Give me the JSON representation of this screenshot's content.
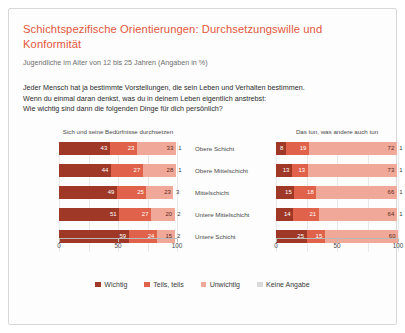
{
  "title": "Schichtspezifische Orientierungen: Durchsetzungswille und Konformität",
  "subtitle": "Jugendliche im Alter von 12 bis 25 Jahren (Angaben in %)",
  "question": {
    "line1": "Jeder Mensch hat ja bestimmte Vorstellungen, die sein Leben und Verhalten bestimmen.",
    "line2": "Wenn du einmal daran denkst, was du in deinem Leben eigentlich anstrebst:",
    "line3": "Wie wichtig sind dann die folgenden Dinge für dich persönlich?"
  },
  "colors": {
    "wichtig": "#a03828",
    "teils_teils": "#e0624a",
    "unwichtig": "#f0a898",
    "keine_angabe": "#d9d9d9",
    "title": "#e2573c"
  },
  "legend": [
    {
      "label": "Wichtig",
      "color": "#a03828"
    },
    {
      "label": "Teils, teils",
      "color": "#e0624a"
    },
    {
      "label": "Unwichtig",
      "color": "#f0a898"
    },
    {
      "label": "Keine Angabe",
      "color": "#d9d9d9"
    }
  ],
  "axis": {
    "ticks": [
      "0",
      "50",
      "100"
    ]
  },
  "categories": [
    "Obere Schicht",
    "Obere Mittelschicht",
    "Mittelschicht",
    "Untere Mittelschicht",
    "Untere Schicht"
  ],
  "chart_data": [
    {
      "type": "bar",
      "orientation": "horizontal",
      "stacked": true,
      "title": "Sich und seine Bedürfnisse durchsetzen",
      "xlabel": "",
      "ylabel": "",
      "xlim": [
        0,
        100
      ],
      "grid": true,
      "legend_position": "bottom",
      "categories": [
        "Obere Schicht",
        "Obere Mittelschicht",
        "Mittelschicht",
        "Untere Mittelschicht",
        "Untere Schicht"
      ],
      "series": [
        {
          "name": "Wichtig",
          "values": [
            43,
            44,
            49,
            51,
            59
          ]
        },
        {
          "name": "Teils, teils",
          "values": [
            23,
            27,
            25,
            27,
            24
          ]
        },
        {
          "name": "Unwichtig",
          "values": [
            33,
            28,
            23,
            20,
            15
          ]
        },
        {
          "name": "Keine Angabe",
          "values": [
            1,
            1,
            3,
            2,
            2
          ]
        }
      ]
    },
    {
      "type": "bar",
      "orientation": "horizontal",
      "stacked": true,
      "title": "Das tun, was andere auch tun",
      "xlabel": "",
      "ylabel": "",
      "xlim": [
        0,
        100
      ],
      "grid": true,
      "legend_position": "bottom",
      "categories": [
        "Obere Schicht",
        "Obere Mittelschicht",
        "Mittelschicht",
        "Untere Mittelschicht",
        "Untere Schicht"
      ],
      "series": [
        {
          "name": "Wichtig",
          "values": [
            8,
            13,
            15,
            14,
            25
          ]
        },
        {
          "name": "Teils, teils",
          "values": [
            19,
            13,
            18,
            21,
            15
          ]
        },
        {
          "name": "Unwichtig",
          "values": [
            72,
            73,
            66,
            64,
            60
          ]
        },
        {
          "name": "Keine Angabe",
          "values": [
            1,
            1,
            1,
            1,
            0
          ]
        }
      ]
    }
  ]
}
